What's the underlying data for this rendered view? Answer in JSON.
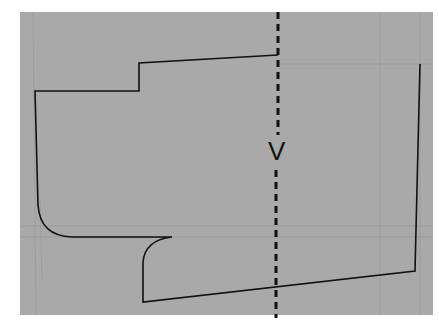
{
  "diagram": {
    "background_color": "#a9a9a9",
    "line_color": "#111111",
    "cut_line": {
      "style": "dashed",
      "label": "V"
    }
  }
}
